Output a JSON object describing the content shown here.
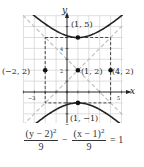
{
  "chart_data": {
    "type": "line",
    "title": "",
    "xlabel": "x",
    "ylabel": "y",
    "xlim": [
      -4,
      5
    ],
    "ylim": [
      -3,
      7
    ],
    "grid": true,
    "x_tick_labels": [
      {
        "value": -3,
        "label": "-3"
      },
      {
        "value": 5,
        "label": "5"
      }
    ],
    "y_tick_labels": [
      {
        "value": 2,
        "label": "2"
      },
      {
        "value": 4,
        "label": "4"
      }
    ],
    "equation": "(y - 2)^2/9 - (x - 1)^2/9 = 1",
    "curve": {
      "type": "hyperbola",
      "center": [
        1,
        2
      ],
      "a": 3,
      "b": 3,
      "orientation": "vertical"
    },
    "asymptotes": [
      "y - 2 = x - 1",
      "y - 2 = -(x - 1)"
    ],
    "fundamental_rectangle": {
      "x": [
        -2,
        4
      ],
      "y": [
        -1,
        5
      ]
    },
    "points": [
      {
        "x": 1,
        "y": 5,
        "label": "(1, 5)"
      },
      {
        "x": 1,
        "y": -1,
        "label": "(1, −1)"
      },
      {
        "x": -2,
        "y": 2,
        "label": "(−2, 2)"
      },
      {
        "x": 1,
        "y": 2,
        "label": "(1, 2)"
      },
      {
        "x": 4,
        "y": 2,
        "label": "(4, 2)"
      }
    ]
  },
  "labels": {
    "x_axis": "x",
    "y_axis": "y",
    "tick_neg3": "−3",
    "tick_5": "5",
    "tick_2": "2",
    "tick_4": "4",
    "p_top": "(1, 5)",
    "p_bottom": "(1, −1)",
    "p_left": "(−2, 2)",
    "p_center": "(1, 2)",
    "p_right": "(4, 2)"
  },
  "equation": {
    "num1": "(y − 2)",
    "num1_exp": "2",
    "den1": "9",
    "minus": "−",
    "num2": "(x − 1)",
    "num2_exp": "2",
    "den2": "9",
    "equals": "= 1"
  }
}
